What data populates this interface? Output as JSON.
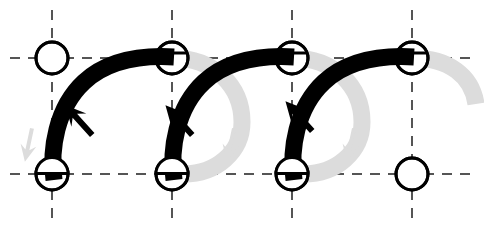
{
  "figure": {
    "title": "",
    "background_color": "#ffffff",
    "width": 484,
    "height": 233
  },
  "chart_data": {
    "type": "diagram",
    "title": "",
    "subtitle": "",
    "xlabel": "",
    "ylabel": "",
    "grid": true,
    "legend": null,
    "colors": {
      "active_stroke": "#000000",
      "ghost_stroke": "#dcdcdc",
      "grid_line": "#555555",
      "node_stroke": "#000000",
      "node_fill": "#ffffff"
    },
    "grid_lines": {
      "vertical_x": [
        52,
        172,
        292,
        412
      ],
      "horizontal_y": [
        58,
        174
      ],
      "dash_pattern": "10 8",
      "stroke_width": 2
    },
    "nodes": [
      {
        "id": "n1",
        "x": 52,
        "y": 58,
        "r": 16,
        "state": "empty"
      },
      {
        "id": "n2",
        "x": 172,
        "y": 58,
        "r": 16,
        "state": "occupied"
      },
      {
        "id": "n3",
        "x": 292,
        "y": 58,
        "r": 16,
        "state": "occupied"
      },
      {
        "id": "n4",
        "x": 412,
        "y": 58,
        "r": 16,
        "state": "occupied"
      },
      {
        "id": "n5",
        "x": 52,
        "y": 174,
        "r": 16,
        "state": "occupied"
      },
      {
        "id": "n6",
        "x": 172,
        "y": 174,
        "r": 16,
        "state": "occupied"
      },
      {
        "id": "n7",
        "x": 292,
        "y": 174,
        "r": 16,
        "state": "occupied"
      },
      {
        "id": "n8",
        "x": 412,
        "y": 174,
        "r": 16,
        "state": "empty"
      }
    ],
    "active_arcs": [
      {
        "id": "a1",
        "from": "n5",
        "to": "n2",
        "stroke_width": 17,
        "color": "#000000"
      },
      {
        "id": "a2",
        "from": "n6",
        "to": "n3",
        "stroke_width": 17,
        "color": "#000000"
      },
      {
        "id": "a3",
        "from": "n7",
        "to": "n4",
        "stroke_width": 17,
        "color": "#000000"
      }
    ],
    "ghost_arcs": [
      {
        "id": "g1",
        "from": "n2",
        "to": "n6",
        "stroke_width": 17,
        "color": "#dcdcdc"
      },
      {
        "id": "g2",
        "from": "n3",
        "to": "n7",
        "stroke_width": 17,
        "color": "#dcdcdc"
      },
      {
        "id": "g3",
        "from": "n4",
        "to": "n8",
        "stroke_width": 17,
        "color": "#dcdcdc"
      }
    ],
    "active_arrows": [
      {
        "id": "ar1",
        "x": 102,
        "y": 122,
        "angle": -45,
        "color": "#000000"
      },
      {
        "id": "ar2",
        "x": 202,
        "y": 122,
        "angle": -45,
        "color": "#000000"
      },
      {
        "id": "ar3",
        "x": 322,
        "y": 118,
        "angle": -45,
        "color": "#000000"
      }
    ],
    "ghost_arrows": [
      {
        "id": "gr1",
        "x": 238,
        "y": 143,
        "angle": 80,
        "color": "#dcdcdc"
      },
      {
        "id": "gr2",
        "x": 358,
        "y": 143,
        "angle": 80,
        "color": "#dcdcdc"
      },
      {
        "id": "gr3",
        "x": 36,
        "y": 143,
        "angle": 80,
        "color": "#dcdcdc"
      }
    ]
  }
}
